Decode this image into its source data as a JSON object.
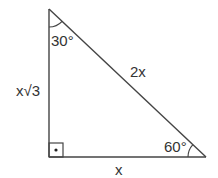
{
  "diagram": {
    "type": "right-triangle",
    "stroke_color": "#444444",
    "labels": {
      "top_angle": "30°",
      "bottom_right_angle": "60°",
      "hypotenuse": "2x",
      "vertical_leg": "x√3",
      "horizontal_leg": "x"
    },
    "right_angle_marker": "square-with-dot"
  }
}
